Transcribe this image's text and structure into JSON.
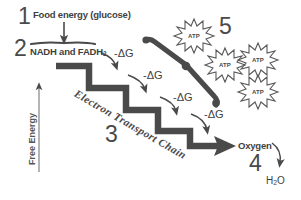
{
  "figure": {
    "background_color": "#ffffff",
    "ink_color": "#4a4a4a",
    "steps": [
      {
        "number": "1",
        "label": "Food energy (glucose)"
      },
      {
        "number": "2",
        "label": "NADH and FADH"
      },
      {
        "number": "3",
        "label": "Electron Transport Chain"
      },
      {
        "number": "4",
        "label": "Oxygen"
      },
      {
        "number": "5",
        "label": "ATP"
      }
    ],
    "axis": {
      "y_label": "Free Energy"
    },
    "delta_g_labels": [
      "-ΔG",
      "-ΔG",
      "-ΔG",
      "-ΔG"
    ],
    "fadh_subscript": "2",
    "oxygen_label": "Oxygen",
    "water_label": "H",
    "water_subscript": "2",
    "water_suffix": "O",
    "atp_bursts": [
      {
        "label": "ATP"
      },
      {
        "label": "ATP"
      },
      {
        "label": "ATP"
      },
      {
        "label": "ATP"
      }
    ],
    "number_five": "5",
    "number_four": "4",
    "number_three": "3",
    "number_two": "2",
    "number_one": "1"
  }
}
